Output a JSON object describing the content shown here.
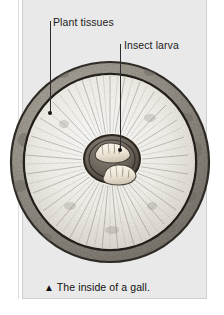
{
  "figure": {
    "caption_marker": "▲",
    "caption_text": "The inside of a gall.",
    "background_color": "#ffffff",
    "panel_color": "#e9e9e9"
  },
  "labels": [
    {
      "id": "plant-tissues",
      "text": "Plant tissues",
      "leader_color": "#2b2b2b"
    },
    {
      "id": "insect-larva",
      "text": "Insect larva",
      "leader_color": "#2b2b2b"
    }
  ],
  "illustration": {
    "subject": "gall-cross-section",
    "parts": {
      "outer_rind": "#9a958c",
      "rind_outline": "#2f2b26",
      "inner_tissue": "#f2f0ea",
      "radiating_fibers": "#8d8880",
      "chamber_ring": "#4a443c",
      "chamber_floor": "#6d675e",
      "larva_body": "#efe9dc",
      "larva_outline": "#4c453b"
    },
    "larva_count": 2
  }
}
